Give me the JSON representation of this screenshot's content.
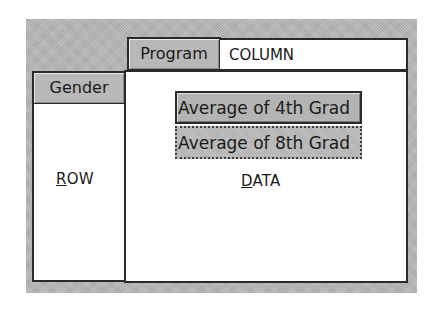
{
  "pivot_layout": {
    "column_area": {
      "field_button": "Program",
      "drop_label": "COLUMN",
      "drop_label_accel": "C",
      "drop_label_rest": "OLUMN"
    },
    "row_area": {
      "field_button": "Gender",
      "drop_label": "ROW",
      "drop_label_accel": "R",
      "drop_label_rest": "OW"
    },
    "data_area": {
      "drop_label": "DATA",
      "drop_label_accel": "D",
      "drop_label_rest": "ATA",
      "fields": [
        {
          "label": "Average of 4th Grad",
          "focused": false
        },
        {
          "label": "Average of 8th Grad",
          "focused": true
        }
      ]
    }
  },
  "colors": {
    "panel_gray": "#b4b4b4",
    "border": "#2a2a2a",
    "drop_area_bg": "#ffffff"
  }
}
